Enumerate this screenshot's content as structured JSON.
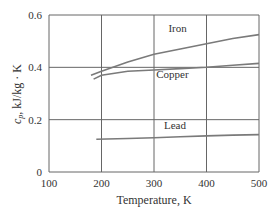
{
  "chart_data": {
    "type": "line",
    "title": "",
    "xlabel": "Temperature, K",
    "ylabel": "c_p, kJ/kg · K",
    "ylabel_parts": {
      "symbol": "c",
      "subscript": "p",
      "units": ", kJ/kg · K"
    },
    "xlim": [
      100,
      500
    ],
    "ylim": [
      0,
      0.6
    ],
    "x_ticks": [
      100,
      200,
      300,
      400,
      500
    ],
    "x_tick_labels": [
      "100",
      "200",
      "300",
      "400",
      "500"
    ],
    "y_ticks": [
      0,
      0.2,
      0.4,
      0.6
    ],
    "y_tick_labels": [
      "0",
      "0.2",
      "0.4",
      "0.6"
    ],
    "grid": true,
    "legend": "inline labels",
    "series": [
      {
        "name": "Iron",
        "x": [
          180,
          200,
          250,
          300,
          350,
          400,
          450,
          500
        ],
        "values": [
          0.37,
          0.385,
          0.42,
          0.45,
          0.47,
          0.49,
          0.51,
          0.525
        ],
        "label_at": [
          345,
          0.535
        ]
      },
      {
        "name": "Copper",
        "x": [
          185,
          200,
          250,
          300,
          350,
          400,
          450,
          500
        ],
        "values": [
          0.355,
          0.37,
          0.385,
          0.39,
          0.395,
          0.4,
          0.408,
          0.415
        ],
        "label_at": [
          335,
          0.36
        ]
      },
      {
        "name": "Lead",
        "x": [
          190,
          250,
          300,
          350,
          400,
          450,
          500
        ],
        "values": [
          0.125,
          0.128,
          0.131,
          0.135,
          0.138,
          0.141,
          0.143
        ],
        "label_at": [
          340,
          0.165
        ]
      }
    ],
    "colors": {
      "axis": "#666666",
      "grid": "#666666",
      "line": "#7a7a7a",
      "text": "#333333"
    }
  }
}
